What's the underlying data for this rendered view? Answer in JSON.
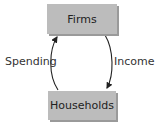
{
  "diagram": {
    "nodes": {
      "top": "Firms",
      "bottom": "Households"
    },
    "flows": {
      "left": "Spending",
      "right": "Income"
    },
    "colors": {
      "box_fill": "#bcbcbc",
      "arrow": "#222222"
    }
  }
}
